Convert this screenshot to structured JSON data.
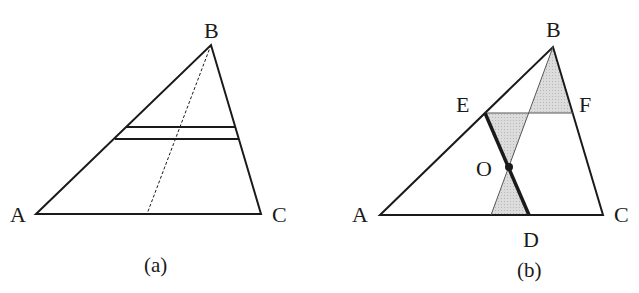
{
  "panels": [
    {
      "caption": "(a)",
      "vertices": {
        "A": {
          "label": "A",
          "x": 36,
          "y": 214
        },
        "B": {
          "label": "B",
          "x": 211,
          "y": 45
        },
        "C": {
          "label": "C",
          "x": 261,
          "y": 214
        }
      },
      "parallel_strip": {
        "upper": {
          "x1": 126,
          "x2": 236,
          "y": 127
        },
        "lower": {
          "x1": 115,
          "x2": 239,
          "y": 139
        }
      },
      "dashed_median": {
        "x1": 211,
        "y1": 45,
        "x2": 147,
        "y2": 214
      }
    },
    {
      "caption": "(b)",
      "vertices": {
        "A": {
          "label": "A",
          "x": 380,
          "y": 215
        },
        "B": {
          "label": "B",
          "x": 553,
          "y": 47
        },
        "C": {
          "label": "C",
          "x": 603,
          "y": 215
        },
        "D": {
          "label": "D",
          "x": 529,
          "y": 215
        },
        "E": {
          "label": "E",
          "x": 485,
          "y": 113
        },
        "F": {
          "label": "F",
          "x": 573,
          "y": 113
        },
        "O": {
          "label": "O",
          "x": 509,
          "y": 167
        }
      },
      "shaded_color": "#d4d4d4",
      "thick_segment": "ED"
    }
  ],
  "colors": {
    "line": "#1a1a1a",
    "shade": "#d4d4d4",
    "background": "#ffffff"
  }
}
